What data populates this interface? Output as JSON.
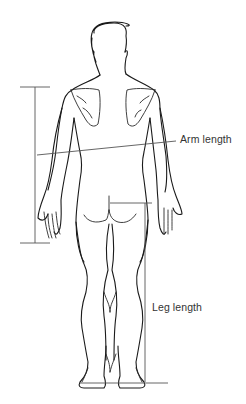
{
  "diagram": {
    "labels": {
      "arm_length": "Arm length",
      "leg_length": "Leg length"
    },
    "colors": {
      "outline": "#1a1a1a",
      "measure_line": "#555555",
      "label_text": "#333333",
      "background": "#ffffff"
    }
  }
}
